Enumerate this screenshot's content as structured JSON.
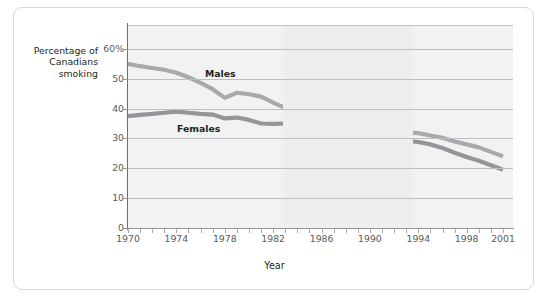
{
  "figure": {
    "y_axis_title": "Percentage of\nCanadians\nsmoking",
    "x_axis_title": "Year"
  },
  "chart_data": {
    "type": "line",
    "title": "",
    "xlabel": "Year",
    "ylabel": "Percentage of Canadians smoking",
    "xlim": [
      1970,
      2001
    ],
    "ylim": [
      0,
      68
    ],
    "grid": true,
    "legend": "inline-labels",
    "ytick_labels": [
      "60%",
      "50",
      "40",
      "30",
      "20",
      "10",
      "0"
    ],
    "ytick_values": [
      60,
      50,
      40,
      30,
      20,
      10,
      0
    ],
    "xtick_labels": [
      "1970",
      "1974",
      "1978",
      "1982",
      "1986",
      "1990",
      "1994",
      "1998",
      "2001"
    ],
    "xtick_values": [
      1970,
      1974,
      1978,
      1982,
      1986,
      1990,
      1994,
      1998,
      2001
    ],
    "x": [
      1970,
      1971,
      1972,
      1973,
      1974,
      1975,
      1976,
      1977,
      1978,
      1979,
      1980,
      1981,
      1982,
      1983,
      1984,
      1985,
      1986,
      1987,
      1988,
      1989,
      1990,
      1991,
      1992,
      1993,
      1994,
      1995,
      1996,
      1997,
      1998,
      1999,
      2000,
      2001
    ],
    "series": [
      {
        "name": "Males",
        "color": "#a7a9ac",
        "values": [
          55.0,
          54.2,
          53.6,
          53.0,
          52.0,
          50.5,
          48.6,
          46.5,
          43.6,
          45.3,
          44.8,
          44.0,
          42.0,
          40.2,
          39.0,
          37.2,
          34.3,
          33.4,
          32.8,
          32.3,
          31.0,
          32.0,
          32.1,
          32.0,
          31.8,
          31.0,
          30.2,
          29.0,
          28.0,
          27.0,
          25.5,
          24.0
        ]
      },
      {
        "name": "Females",
        "color": "#939598",
        "values": [
          37.5,
          37.9,
          38.2,
          38.6,
          39.0,
          38.6,
          38.2,
          38.0,
          36.7,
          37.0,
          36.2,
          35.0,
          34.9,
          35.0,
          34.4,
          33.0,
          29.5,
          30.0,
          30.3,
          30.6,
          27.3,
          30.2,
          29.6,
          29.2,
          28.8,
          28.0,
          26.8,
          25.2,
          23.8,
          22.5,
          21.0,
          19.5
        ]
      }
    ],
    "annotations": [
      {
        "text": "Males",
        "x": 1976,
        "y": 51
      },
      {
        "text": "Females",
        "x": 1974,
        "y": 33
      }
    ]
  }
}
